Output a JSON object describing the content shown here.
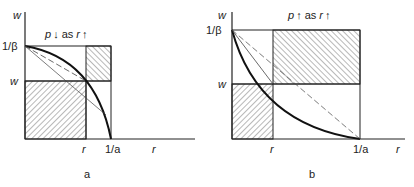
{
  "panels": [
    {
      "id": "a",
      "caption": "a",
      "title": "p ↓ as r ↑",
      "y_axis_label": "w",
      "x_axis_label": "r",
      "y_ticks": [
        "1/β",
        "w"
      ],
      "x_ticks": [
        "r",
        "1/a"
      ],
      "curve": "concave"
    },
    {
      "id": "b",
      "caption": "b",
      "title": "p ↑ as r ↑",
      "y_axis_label": "w",
      "x_axis_label": "r",
      "y_ticks": [
        "1/β",
        "w"
      ],
      "x_ticks": [
        "r",
        "1/a"
      ],
      "curve": "convex"
    }
  ],
  "colors": {
    "ink": "#222222",
    "thin": "#555555"
  }
}
